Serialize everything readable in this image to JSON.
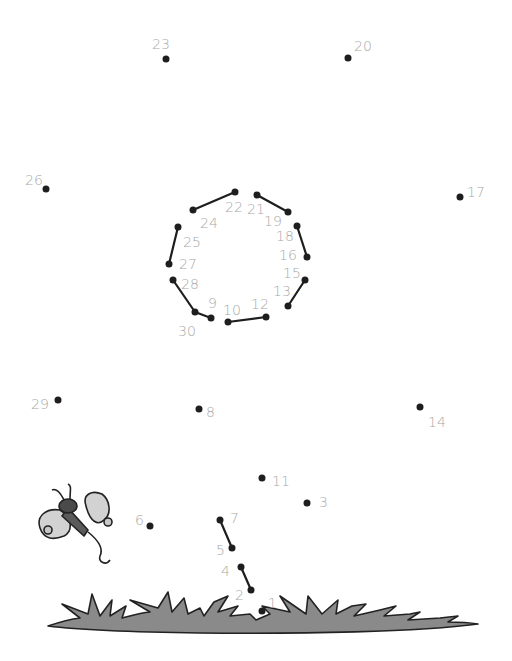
{
  "puzzle": {
    "type": "connect-the-dots",
    "dot_color": "#1e1e1e",
    "label_color": "#a8a8a8",
    "line_color": "#1e1e1e",
    "dots": [
      {
        "n": "1",
        "x": 262,
        "y": 611,
        "lx": 268,
        "ly": 596
      },
      {
        "n": "2",
        "x": 251,
        "y": 590,
        "lx": 235,
        "ly": 588
      },
      {
        "n": "3",
        "x": 307,
        "y": 503,
        "lx": 319,
        "ly": 495
      },
      {
        "n": "4",
        "x": 241,
        "y": 567,
        "lx": 221,
        "ly": 564
      },
      {
        "n": "5",
        "x": 232,
        "y": 548,
        "lx": 216,
        "ly": 543
      },
      {
        "n": "6",
        "x": 150,
        "y": 526,
        "lx": 135,
        "ly": 513
      },
      {
        "n": "7",
        "x": 220,
        "y": 520,
        "lx": 230,
        "ly": 511
      },
      {
        "n": "8",
        "x": 199,
        "y": 409,
        "lx": 206,
        "ly": 405
      },
      {
        "n": "9",
        "x": 211,
        "y": 318,
        "lx": 208,
        "ly": 296
      },
      {
        "n": "10",
        "x": 228,
        "y": 322,
        "lx": 223,
        "ly": 303
      },
      {
        "n": "11",
        "x": 262,
        "y": 478,
        "lx": 272,
        "ly": 474
      },
      {
        "n": "12",
        "x": 266,
        "y": 317,
        "lx": 251,
        "ly": 297
      },
      {
        "n": "13",
        "x": 288,
        "y": 306,
        "lx": 273,
        "ly": 284
      },
      {
        "n": "14",
        "x": 420,
        "y": 407,
        "lx": 428,
        "ly": 415
      },
      {
        "n": "15",
        "x": 305,
        "y": 280,
        "lx": 283,
        "ly": 266
      },
      {
        "n": "16",
        "x": 307,
        "y": 257,
        "lx": 279,
        "ly": 248
      },
      {
        "n": "17",
        "x": 460,
        "y": 197,
        "lx": 467,
        "ly": 185
      },
      {
        "n": "18",
        "x": 297,
        "y": 226,
        "lx": 276,
        "ly": 229
      },
      {
        "n": "19",
        "x": 288,
        "y": 212,
        "lx": 264,
        "ly": 214
      },
      {
        "n": "20",
        "x": 348,
        "y": 58,
        "lx": 354,
        "ly": 39
      },
      {
        "n": "21",
        "x": 257,
        "y": 195,
        "lx": 247,
        "ly": 202
      },
      {
        "n": "22",
        "x": 235,
        "y": 192,
        "lx": 225,
        "ly": 200
      },
      {
        "n": "23",
        "x": 166,
        "y": 59,
        "lx": 152,
        "ly": 37
      },
      {
        "n": "24",
        "x": 193,
        "y": 210,
        "lx": 200,
        "ly": 216
      },
      {
        "n": "25",
        "x": 178,
        "y": 227,
        "lx": 183,
        "ly": 235
      },
      {
        "n": "26",
        "x": 46,
        "y": 189,
        "lx": 25,
        "ly": 173
      },
      {
        "n": "27",
        "x": 169,
        "y": 264,
        "lx": 179,
        "ly": 257
      },
      {
        "n": "28",
        "x": 173,
        "y": 280,
        "lx": 181,
        "ly": 277
      },
      {
        "n": "29",
        "x": 58,
        "y": 400,
        "lx": 31,
        "ly": 397
      },
      {
        "n": "30",
        "x": 195,
        "y": 312,
        "lx": 178,
        "ly": 324
      }
    ],
    "connected_segments": [
      [
        "22",
        "24"
      ],
      [
        "21",
        "19"
      ],
      [
        "18",
        "16"
      ],
      [
        "25",
        "27"
      ],
      [
        "28",
        "30"
      ],
      [
        "30",
        "9"
      ],
      [
        "10",
        "12"
      ],
      [
        "15",
        "13"
      ],
      [
        "7",
        "5"
      ],
      [
        "4",
        "2"
      ]
    ],
    "decorations": [
      "butterfly",
      "grass"
    ]
  }
}
